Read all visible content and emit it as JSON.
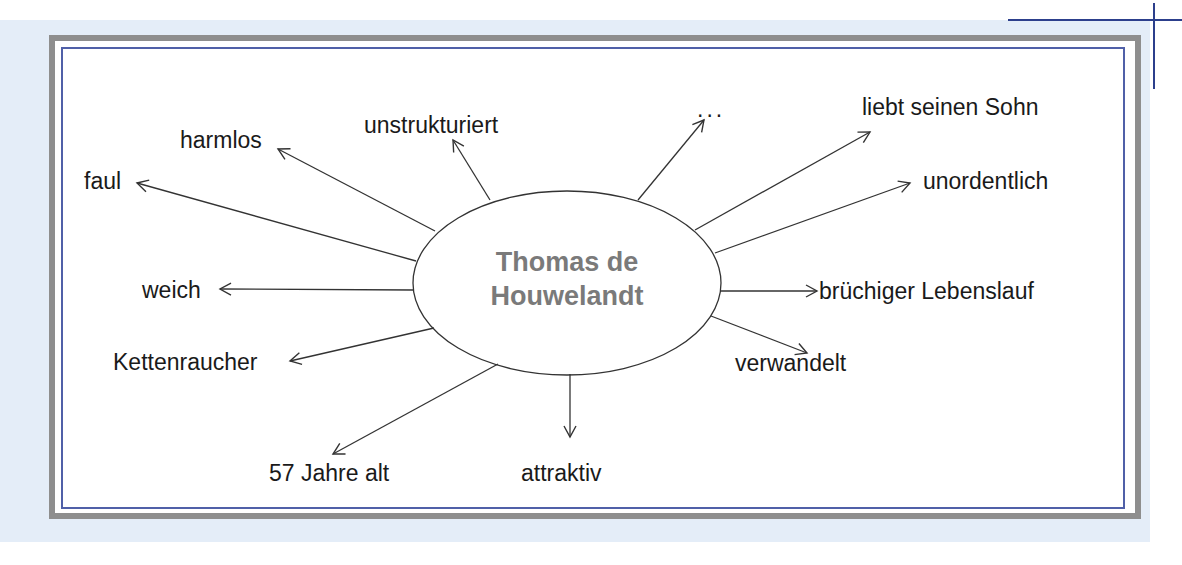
{
  "diagram": {
    "type": "mind-map",
    "center": {
      "line1": "Thomas de",
      "line2": "Houwelandt"
    },
    "nodes": [
      {
        "id": "harmlos",
        "label": "harmlos"
      },
      {
        "id": "unstrukturiert",
        "label": "unstrukturiert"
      },
      {
        "id": "ellipsis",
        "label": "..."
      },
      {
        "id": "liebt-seinen-sohn",
        "label": "liebt seinen Sohn"
      },
      {
        "id": "faul",
        "label": "faul"
      },
      {
        "id": "unordentlich",
        "label": "unordentlich"
      },
      {
        "id": "weich",
        "label": "weich"
      },
      {
        "id": "bruechiger-lebenslauf",
        "label": "brüchiger Lebenslauf"
      },
      {
        "id": "kettenraucher",
        "label": "Kettenraucher"
      },
      {
        "id": "verwandelt",
        "label": "verwandelt"
      },
      {
        "id": "57-jahre-alt",
        "label": "57 Jahre alt"
      },
      {
        "id": "attraktiv",
        "label": "attraktiv"
      }
    ],
    "colors": {
      "background_panel": "#e4edf8",
      "outer_border": "#8e8e8e",
      "inner_border": "#5060a8",
      "crop_marks": "#2c3f8c",
      "center_text": "#7a7a7a",
      "text": "#1a1a1a",
      "lines": "#333333"
    }
  }
}
